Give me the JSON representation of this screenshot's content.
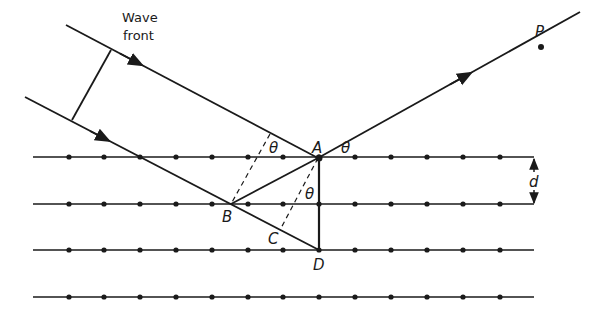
{
  "labels": {
    "wavefront_line1": "Wave",
    "wavefront_line2": "front",
    "point_P": "P",
    "point_A": "A",
    "point_B": "B",
    "point_C": "C",
    "point_D": "D",
    "theta_incident": "θ",
    "theta_reflected": "θ",
    "theta_inner": "θ",
    "spacing_d": "d"
  },
  "lattice": {
    "rows_y": [
      157,
      204,
      250,
      297
    ],
    "x_start": 33,
    "x_end": 534,
    "dots_x": [
      69,
      104,
      140,
      176,
      212,
      248,
      283,
      319,
      355,
      391,
      427,
      463,
      500
    ]
  },
  "colors": {
    "ink": "#1a1a1a",
    "background": "#ffffff"
  }
}
